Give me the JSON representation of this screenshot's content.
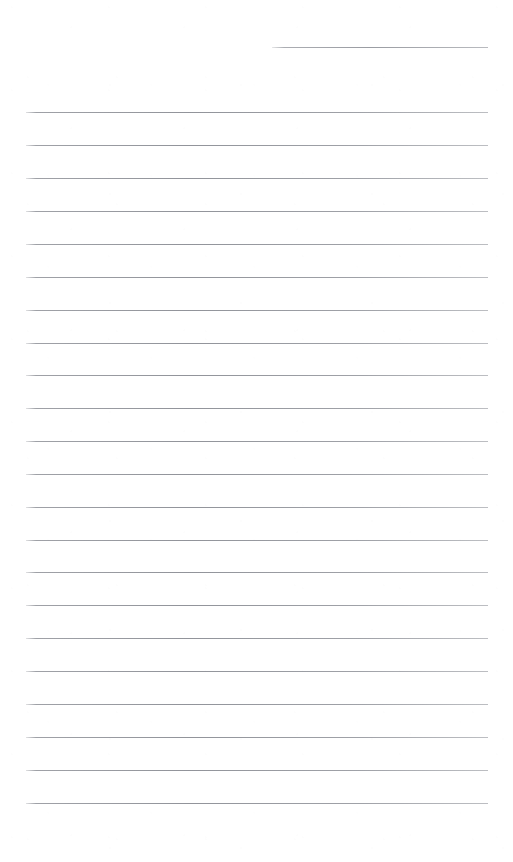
{
  "document": {
    "kind": "lined-notepaper",
    "title": "Blank ruled notebook page",
    "page_width": 513,
    "page_height": 862,
    "background_color": "#ffffff",
    "rule_color": "#7a7d85",
    "rule_thickness_px": 1,
    "written_text": "",
    "margin_left_px": 26,
    "margin_right_px": 488,
    "line_spacing_px": 33,
    "first_full_line_y_px": 112,
    "last_full_line_y_px": 803,
    "full_line_count": 22,
    "partial_line_count": 1,
    "bottom_blank_space_px": 59,
    "lines": [
      {
        "id": "rule-partial-1",
        "y": 47,
        "x1": 272,
        "x2": 488,
        "variant": "short"
      },
      {
        "id": "rule-1",
        "y": 112,
        "x1": 26,
        "x2": 488,
        "variant": "full"
      },
      {
        "id": "rule-2",
        "y": 145,
        "x1": 26,
        "x2": 488,
        "variant": "full"
      },
      {
        "id": "rule-3",
        "y": 178,
        "x1": 26,
        "x2": 488,
        "variant": "full"
      },
      {
        "id": "rule-4",
        "y": 211,
        "x1": 26,
        "x2": 488,
        "variant": "full"
      },
      {
        "id": "rule-5",
        "y": 244,
        "x1": 26,
        "x2": 488,
        "variant": "full"
      },
      {
        "id": "rule-6",
        "y": 277,
        "x1": 26,
        "x2": 488,
        "variant": "full"
      },
      {
        "id": "rule-7",
        "y": 310,
        "x1": 26,
        "x2": 488,
        "variant": "full"
      },
      {
        "id": "rule-8",
        "y": 343,
        "x1": 26,
        "x2": 488,
        "variant": "full"
      },
      {
        "id": "rule-9",
        "y": 375,
        "x1": 26,
        "x2": 488,
        "variant": "full"
      },
      {
        "id": "rule-10",
        "y": 408,
        "x1": 26,
        "x2": 488,
        "variant": "full"
      },
      {
        "id": "rule-11",
        "y": 441,
        "x1": 26,
        "x2": 488,
        "variant": "full"
      },
      {
        "id": "rule-12",
        "y": 474,
        "x1": 26,
        "x2": 488,
        "variant": "full"
      },
      {
        "id": "rule-13",
        "y": 507,
        "x1": 26,
        "x2": 488,
        "variant": "full"
      },
      {
        "id": "rule-14",
        "y": 540,
        "x1": 26,
        "x2": 488,
        "variant": "full"
      },
      {
        "id": "rule-15",
        "y": 572,
        "x1": 26,
        "x2": 488,
        "variant": "full"
      },
      {
        "id": "rule-16",
        "y": 605,
        "x1": 26,
        "x2": 488,
        "variant": "full"
      },
      {
        "id": "rule-17",
        "y": 638,
        "x1": 26,
        "x2": 488,
        "variant": "full"
      },
      {
        "id": "rule-18",
        "y": 671,
        "x1": 26,
        "x2": 488,
        "variant": "full"
      },
      {
        "id": "rule-19",
        "y": 704,
        "x1": 26,
        "x2": 488,
        "variant": "full"
      },
      {
        "id": "rule-20",
        "y": 737,
        "x1": 26,
        "x2": 488,
        "variant": "full"
      },
      {
        "id": "rule-21",
        "y": 770,
        "x1": 26,
        "x2": 488,
        "variant": "full"
      },
      {
        "id": "rule-22",
        "y": 803,
        "x1": 26,
        "x2": 488,
        "variant": "full"
      }
    ]
  }
}
